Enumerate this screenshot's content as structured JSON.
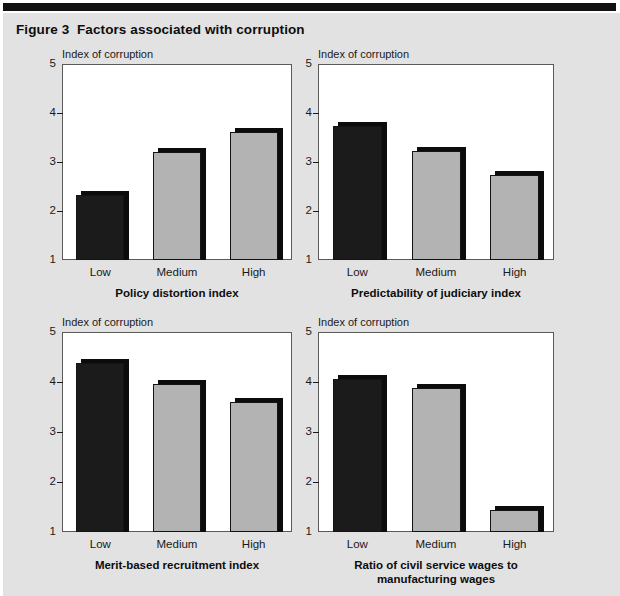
{
  "figure": {
    "title": "Figure 3  Factors associated with corruption"
  },
  "chart_data": [
    {
      "type": "bar",
      "id": "policy-distortion",
      "title": "Policy distortion index",
      "ylabel": "Index of corruption",
      "xlabel": "",
      "categories": [
        "Low",
        "Medium",
        "High"
      ],
      "values": [
        2.33,
        3.21,
        3.61
      ],
      "ylim": [
        1,
        5
      ],
      "yticks": [
        1,
        2,
        3,
        4,
        5
      ],
      "grid": false,
      "legend": "none",
      "colors": [
        "#1b1b1b",
        "#b3b3b3",
        "#b3b3b3"
      ]
    },
    {
      "type": "bar",
      "id": "predictability-judiciary",
      "title": "Predictability of judiciary index",
      "ylabel": "Index of corruption",
      "xlabel": "",
      "categories": [
        "Low",
        "Medium",
        "High"
      ],
      "values": [
        3.74,
        3.23,
        2.73
      ],
      "ylim": [
        1,
        5
      ],
      "yticks": [
        1,
        2,
        3,
        4,
        5
      ],
      "grid": false,
      "legend": "none",
      "colors": [
        "#1b1b1b",
        "#b3b3b3",
        "#b3b3b3"
      ]
    },
    {
      "type": "bar",
      "id": "merit-based-recruitment",
      "title": "Merit-based recruitment index",
      "ylabel": "Index of corruption",
      "xlabel": "",
      "categories": [
        "Low",
        "Medium",
        "High"
      ],
      "values": [
        4.38,
        3.97,
        3.6
      ],
      "ylim": [
        1,
        5
      ],
      "yticks": [
        1,
        2,
        3,
        4,
        5
      ],
      "grid": false,
      "legend": "none",
      "colors": [
        "#1b1b1b",
        "#b3b3b3",
        "#b3b3b3"
      ]
    },
    {
      "type": "bar",
      "id": "civil-service-wage-ratio",
      "title": "Ratio of civil service wages to\nmanufacturing wages",
      "title_line1": "Ratio of civil service wages to",
      "title_line2": "manufacturing wages",
      "ylabel": "Index of corruption",
      "xlabel": "",
      "categories": [
        "Low",
        "Medium",
        "High"
      ],
      "values": [
        4.07,
        3.88,
        1.45
      ],
      "ylim": [
        1,
        5
      ],
      "yticks": [
        1,
        2,
        3,
        4,
        5
      ],
      "grid": false,
      "legend": "none",
      "colors": [
        "#1b1b1b",
        "#b3b3b3",
        "#b3b3b3"
      ]
    }
  ],
  "style": {
    "page_background": "#e2e2e2",
    "plot_background": "#ffffff",
    "rule_color": "#111111",
    "bar_dark": "#1b1b1b",
    "bar_light": "#b3b3b3",
    "bar_outline": "#141414"
  }
}
